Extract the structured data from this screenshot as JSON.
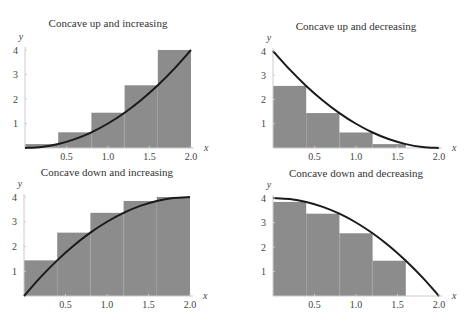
{
  "chart_data": [
    {
      "type": "bar",
      "title": "Concave up and increasing",
      "function": "x^2",
      "xlabel": "x",
      "ylabel": "y",
      "xlim": [
        0,
        2
      ],
      "ylim": [
        0,
        4
      ],
      "xticks": [
        "0.5",
        "1.0",
        "1.5",
        "2.0"
      ],
      "yticks": [
        "1",
        "2",
        "3",
        "4"
      ],
      "rect_edges": [
        0,
        0.4,
        0.8,
        1.2,
        1.6,
        2.0
      ],
      "values": [
        0.16,
        0.64,
        1.44,
        2.56,
        4.0
      ],
      "curve": {
        "x": [
          0,
          0.2,
          0.4,
          0.6,
          0.8,
          1.0,
          1.2,
          1.4,
          1.6,
          1.8,
          2.0
        ],
        "y": [
          0,
          0.04,
          0.16,
          0.36,
          0.64,
          1.0,
          1.44,
          1.96,
          2.56,
          3.24,
          4.0
        ]
      },
      "grid": false
    },
    {
      "type": "bar",
      "title": "Concave up and decreasing",
      "function": "(x-2)^2",
      "xlabel": "x",
      "ylabel": "y",
      "xlim": [
        0,
        2
      ],
      "ylim": [
        0,
        4
      ],
      "xticks": [
        "0.5",
        "1.0",
        "1.5",
        "2.0"
      ],
      "yticks": [
        "1",
        "2",
        "3",
        "4"
      ],
      "rect_edges": [
        0,
        0.4,
        0.8,
        1.2,
        1.6,
        2.0
      ],
      "values": [
        2.56,
        1.44,
        0.64,
        0.16,
        0.0
      ],
      "curve": {
        "x": [
          0,
          0.2,
          0.4,
          0.6,
          0.8,
          1.0,
          1.2,
          1.4,
          1.6,
          1.8,
          2.0
        ],
        "y": [
          4.0,
          3.24,
          2.56,
          1.96,
          1.44,
          1.0,
          0.64,
          0.36,
          0.16,
          0.04,
          0
        ]
      },
      "grid": false
    },
    {
      "type": "bar",
      "title": "Concave down and increasing",
      "function": "4-(x-2)^2",
      "xlabel": "x",
      "ylabel": "y",
      "xlim": [
        0,
        2
      ],
      "ylim": [
        0,
        4
      ],
      "xticks": [
        "0.5",
        "1.0",
        "1.5",
        "2.0"
      ],
      "yticks": [
        "1",
        "2",
        "3",
        "4"
      ],
      "rect_edges": [
        0,
        0.4,
        0.8,
        1.2,
        1.6,
        2.0
      ],
      "values": [
        1.44,
        2.56,
        3.36,
        3.84,
        4.0
      ],
      "curve": {
        "x": [
          0,
          0.2,
          0.4,
          0.6,
          0.8,
          1.0,
          1.2,
          1.4,
          1.6,
          1.8,
          2.0
        ],
        "y": [
          0,
          0.76,
          1.44,
          2.04,
          2.56,
          3.0,
          3.36,
          3.64,
          3.84,
          3.96,
          4.0
        ]
      },
      "grid": false
    },
    {
      "type": "bar",
      "title": "Concave down and decreasing",
      "function": "4-x^2",
      "xlabel": "x",
      "ylabel": "y",
      "xlim": [
        0,
        2
      ],
      "ylim": [
        0,
        4
      ],
      "xticks": [
        "0.5",
        "1.0",
        "1.5",
        "2.0"
      ],
      "yticks": [
        "1",
        "2",
        "3",
        "4"
      ],
      "rect_edges": [
        0,
        0.4,
        0.8,
        1.2,
        1.6,
        2.0
      ],
      "values": [
        3.84,
        3.36,
        2.56,
        1.44,
        0.0
      ],
      "curve": {
        "x": [
          0,
          0.2,
          0.4,
          0.6,
          0.8,
          1.0,
          1.2,
          1.4,
          1.6,
          1.8,
          2.0
        ],
        "y": [
          4.0,
          3.96,
          3.84,
          3.64,
          3.36,
          3.0,
          2.56,
          2.04,
          1.44,
          0.76,
          0
        ]
      },
      "grid": false
    }
  ],
  "style": {
    "fill_color": "#8c8c8c",
    "curve_color": "#1a1a1a",
    "axis_color": "#cccccc",
    "text_color": "#444444"
  },
  "layout": [
    {
      "x0": 25,
      "x1": 191,
      "y0": 148,
      "y4": 50,
      "title_x": 108,
      "title_y": 17
    },
    {
      "x0": 273,
      "x1": 439,
      "y0": 148,
      "y4": 51,
      "title_x": 356,
      "title_y": 20
    },
    {
      "x0": 24,
      "x1": 190,
      "y0": 296,
      "y4": 197,
      "title_x": 107,
      "title_y": 166
    },
    {
      "x0": 273,
      "x1": 439,
      "y0": 296,
      "y4": 198,
      "title_x": 356,
      "title_y": 167
    }
  ]
}
